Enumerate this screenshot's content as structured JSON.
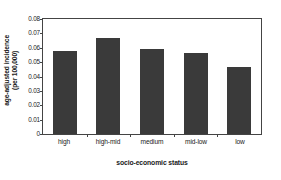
{
  "chart_data": {
    "type": "bar",
    "title": "",
    "subtitle": "",
    "categories": [
      "high",
      "high-mid",
      "medium",
      "mid-low",
      "low"
    ],
    "values": [
      0.0575,
      0.0665,
      0.0588,
      0.0563,
      0.0463
    ],
    "xlabel": "socio-economic status",
    "ylabel_line1": "age-adjusted incidence",
    "ylabel_line2": "(per 100,000)",
    "ylim": [
      0,
      0.08
    ],
    "yticks": [
      0,
      0.01,
      0.02,
      0.03,
      0.04,
      0.05,
      0.06,
      0.07,
      0.08
    ],
    "ytick_labels": [
      "0",
      "0.01",
      "0.02",
      "0.03",
      "0.04",
      "0.05",
      "0.06",
      "0.07",
      "0.08"
    ],
    "grid": false,
    "legend": "none",
    "bar_color": "#3a3a3a",
    "axis_color": "#444444",
    "background_color": "#ffffff"
  }
}
